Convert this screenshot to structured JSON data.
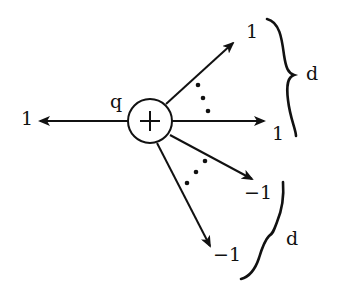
{
  "diagram": {
    "node": {
      "symbol": "+",
      "label": "q",
      "center": [
        150,
        121
      ],
      "radius": 22
    },
    "edges": [
      {
        "id": "left",
        "label": "1",
        "direction": "left"
      },
      {
        "id": "upper-right",
        "label": "1",
        "direction": "up-right"
      },
      {
        "id": "right",
        "label": "1",
        "direction": "right"
      },
      {
        "id": "lower-right",
        "label": "−1",
        "direction": "down-right"
      },
      {
        "id": "down",
        "label": "−1",
        "direction": "down"
      }
    ],
    "braces": [
      {
        "id": "upper",
        "label": "d",
        "groups": [
          "upper-right",
          "right"
        ]
      },
      {
        "id": "lower",
        "label": "d",
        "groups": [
          "lower-right",
          "down"
        ]
      }
    ],
    "ellipses": [
      "upper",
      "lower"
    ],
    "colors": {
      "ink": "#111111",
      "background": "#ffffff"
    }
  }
}
